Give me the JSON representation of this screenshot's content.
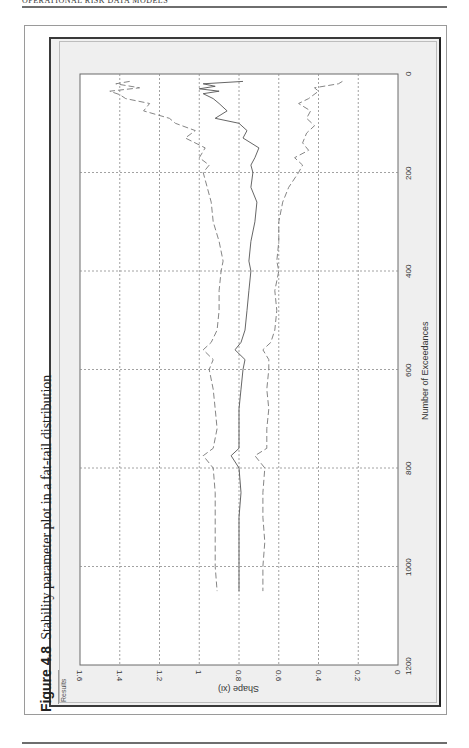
{
  "page": {
    "running_head": "OPERATIONAL RISK DATA MODELS",
    "caption_number": "Figure 4.8",
    "caption_text": "Stability parameter plot in a fat-tail distribution",
    "window_label": "Results"
  },
  "chart_data": {
    "type": "line",
    "title": "Stability parameter plot in a fat-tail distribution",
    "orientation_note": "figure printed rotated 90 degrees counter-clockwise on the page",
    "xlabel": "Number of Exceedances",
    "ylabel": "Shape (xi)",
    "xlim": [
      0,
      1200
    ],
    "ylim": [
      0,
      1.6
    ],
    "x_ticks": [
      0,
      200,
      400,
      600,
      800,
      1000,
      1200
    ],
    "y_ticks": [
      0,
      0.2,
      0.4,
      0.6,
      0.8,
      1,
      1.2,
      1.4,
      1.6
    ],
    "y_tick_labels": [
      "0",
      "0.2",
      "0.4",
      "0.6",
      "0.8",
      "1",
      "1.2",
      "1.4",
      "1.6"
    ],
    "grid": true,
    "legend": "none",
    "series": [
      {
        "name": "Upper confidence bound",
        "style": "dashed",
        "x": [
          15,
          20,
          28,
          35,
          42,
          50,
          60,
          75,
          90,
          100,
          115,
          130,
          150,
          170,
          185,
          200,
          230,
          260,
          300,
          340,
          380,
          400,
          440,
          480,
          520,
          545,
          560,
          580,
          600,
          640,
          680,
          720,
          760,
          775,
          800,
          850,
          900,
          950,
          1000,
          1050
        ],
        "values": [
          1.35,
          1.42,
          1.3,
          1.45,
          1.4,
          1.37,
          1.25,
          1.28,
          1.15,
          1.12,
          1.02,
          1.07,
          0.97,
          1.0,
          0.95,
          0.98,
          0.96,
          0.94,
          0.93,
          0.9,
          0.88,
          0.89,
          0.9,
          0.9,
          0.91,
          0.94,
          0.98,
          0.93,
          0.95,
          0.93,
          0.92,
          0.91,
          0.93,
          0.98,
          0.93,
          0.92,
          0.92,
          0.92,
          0.92,
          0.91
        ]
      },
      {
        "name": "Shape estimate",
        "style": "solid",
        "x": [
          15,
          20,
          25,
          30,
          35,
          40,
          50,
          60,
          75,
          90,
          100,
          115,
          130,
          150,
          170,
          185,
          200,
          230,
          260,
          300,
          340,
          380,
          400,
          440,
          480,
          520,
          545,
          560,
          580,
          600,
          640,
          680,
          720,
          760,
          775,
          800,
          850,
          900,
          950,
          1000,
          1050
        ],
        "values": [
          0.78,
          0.98,
          0.92,
          1.0,
          0.9,
          0.98,
          0.93,
          0.9,
          0.86,
          0.92,
          0.8,
          0.76,
          0.78,
          0.7,
          0.72,
          0.74,
          0.73,
          0.74,
          0.71,
          0.72,
          0.74,
          0.75,
          0.74,
          0.75,
          0.76,
          0.77,
          0.79,
          0.82,
          0.77,
          0.78,
          0.79,
          0.8,
          0.8,
          0.8,
          0.84,
          0.8,
          0.79,
          0.8,
          0.8,
          0.8,
          0.8
        ]
      },
      {
        "name": "Lower confidence bound",
        "style": "dashed",
        "x": [
          15,
          20,
          28,
          35,
          50,
          60,
          75,
          90,
          105,
          120,
          140,
          155,
          170,
          185,
          200,
          230,
          260,
          300,
          340,
          380,
          400,
          440,
          480,
          520,
          545,
          560,
          580,
          600,
          640,
          680,
          720,
          760,
          775,
          800,
          850,
          900,
          950,
          1000,
          1050
        ],
        "values": [
          0.28,
          0.3,
          0.42,
          0.4,
          0.45,
          0.5,
          0.44,
          0.46,
          0.42,
          0.46,
          0.48,
          0.45,
          0.52,
          0.48,
          0.5,
          0.55,
          0.58,
          0.6,
          0.6,
          0.61,
          0.6,
          0.62,
          0.61,
          0.62,
          0.64,
          0.68,
          0.65,
          0.65,
          0.66,
          0.65,
          0.66,
          0.66,
          0.72,
          0.67,
          0.68,
          0.68,
          0.67,
          0.68,
          0.68
        ]
      }
    ]
  }
}
